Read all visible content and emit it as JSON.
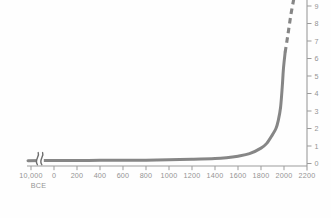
{
  "chart_data": {
    "type": "line",
    "title": "",
    "x_axis": {
      "tick_labels": [
        "10,000",
        "0",
        "200",
        "400",
        "600",
        "800",
        "1000",
        "1200",
        "1400",
        "1600",
        "1800",
        "2000",
        "2200"
      ],
      "first_tick_sublabel": "BCE",
      "broken_axis": true
    },
    "y_axis": {
      "side": "right",
      "range": [
        0,
        9
      ],
      "tick_labels": [
        "0",
        "1",
        "2",
        "3",
        "4",
        "5",
        "6",
        "7",
        "8",
        "9"
      ]
    },
    "legend": "none",
    "grid": false,
    "series": [
      {
        "name": "population-observed",
        "style": "solid",
        "points": [
          [
            -10000,
            0.16
          ],
          [
            0,
            0.17
          ],
          [
            200,
            0.17
          ],
          [
            400,
            0.18
          ],
          [
            600,
            0.18
          ],
          [
            800,
            0.19
          ],
          [
            1000,
            0.21
          ],
          [
            1200,
            0.24
          ],
          [
            1400,
            0.28
          ],
          [
            1500,
            0.33
          ],
          [
            1600,
            0.42
          ],
          [
            1700,
            0.56
          ],
          [
            1800,
            0.88
          ],
          [
            1850,
            1.15
          ],
          [
            1900,
            1.65
          ],
          [
            1930,
            2.0
          ],
          [
            1950,
            2.45
          ],
          [
            1970,
            3.2
          ],
          [
            1985,
            4.4
          ],
          [
            1995,
            5.4
          ],
          [
            2010,
            6.35
          ]
        ]
      },
      {
        "name": "population-projected",
        "style": "dashed",
        "points": [
          [
            2010,
            6.35
          ],
          [
            2035,
            7.4
          ],
          [
            2060,
            8.5
          ],
          [
            2085,
            9.4
          ]
        ]
      }
    ]
  },
  "colors": {
    "curve": "#868686",
    "break_mark": "#6e6e6e",
    "axis": "#9b9b9b",
    "labels": "#949494",
    "background": "#fefefe"
  }
}
